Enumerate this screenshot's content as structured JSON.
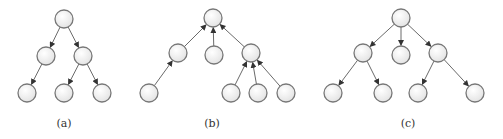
{
  "figure": {
    "node_radius": 9,
    "colors": {
      "edge": "#6a6a6a",
      "node_stroke": "#777777",
      "node_fill_light": "#ffffff",
      "node_fill_dark": "#e4e4e4",
      "caption": "#333333"
    },
    "panels": [
      {
        "id": "a",
        "caption": "(a)",
        "caption_pos": [
          64,
          117
        ],
        "direction": "top-down",
        "nodes": [
          {
            "id": "a0",
            "x": 64,
            "y": 19
          },
          {
            "id": "a1",
            "x": 46,
            "y": 56
          },
          {
            "id": "a2",
            "x": 83,
            "y": 56
          },
          {
            "id": "a3",
            "x": 27,
            "y": 93
          },
          {
            "id": "a4",
            "x": 64,
            "y": 93
          },
          {
            "id": "a5",
            "x": 102,
            "y": 93
          }
        ],
        "edges": [
          {
            "from": "a0",
            "to": "a1"
          },
          {
            "from": "a0",
            "to": "a2"
          },
          {
            "from": "a1",
            "to": "a3"
          },
          {
            "from": "a2",
            "to": "a4"
          },
          {
            "from": "a2",
            "to": "a5"
          }
        ]
      },
      {
        "id": "b",
        "caption": "(b)",
        "caption_pos": [
          212,
          117
        ],
        "direction": "bottom-up",
        "nodes": [
          {
            "id": "b0",
            "x": 213,
            "y": 18
          },
          {
            "id": "b1",
            "x": 178,
            "y": 53
          },
          {
            "id": "b2",
            "x": 214,
            "y": 55
          },
          {
            "id": "b3",
            "x": 251,
            "y": 53
          },
          {
            "id": "b4",
            "x": 149,
            "y": 93
          },
          {
            "id": "b5",
            "x": 231,
            "y": 93
          },
          {
            "id": "b6",
            "x": 258,
            "y": 93
          },
          {
            "id": "b7",
            "x": 286,
            "y": 93
          }
        ],
        "edges": [
          {
            "from": "b1",
            "to": "b0"
          },
          {
            "from": "b2",
            "to": "b0"
          },
          {
            "from": "b3",
            "to": "b0"
          },
          {
            "from": "b4",
            "to": "b1"
          },
          {
            "from": "b5",
            "to": "b3"
          },
          {
            "from": "b6",
            "to": "b3"
          },
          {
            "from": "b7",
            "to": "b3"
          }
        ]
      },
      {
        "id": "c",
        "caption": "(c)",
        "caption_pos": [
          408,
          117
        ],
        "direction": "top-down",
        "nodes": [
          {
            "id": "c0",
            "x": 401,
            "y": 18
          },
          {
            "id": "c1",
            "x": 363,
            "y": 53
          },
          {
            "id": "c2",
            "x": 401,
            "y": 55
          },
          {
            "id": "c3",
            "x": 438,
            "y": 53
          },
          {
            "id": "c4",
            "x": 333,
            "y": 93
          },
          {
            "id": "c5",
            "x": 383,
            "y": 93
          },
          {
            "id": "c6",
            "x": 418,
            "y": 93
          },
          {
            "id": "c7",
            "x": 475,
            "y": 93
          }
        ],
        "edges": [
          {
            "from": "c0",
            "to": "c1"
          },
          {
            "from": "c0",
            "to": "c2"
          },
          {
            "from": "c0",
            "to": "c3"
          },
          {
            "from": "c1",
            "to": "c4"
          },
          {
            "from": "c1",
            "to": "c5"
          },
          {
            "from": "c3",
            "to": "c6"
          },
          {
            "from": "c3",
            "to": "c7"
          }
        ]
      }
    ]
  }
}
